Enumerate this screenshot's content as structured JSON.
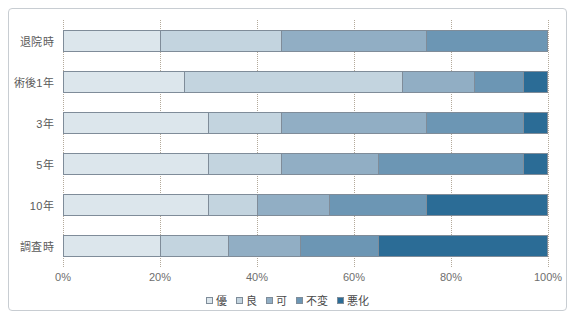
{
  "chart_data": {
    "type": "bar",
    "orientation": "horizontal",
    "stacked": true,
    "stacked_mode": "percent",
    "title": "",
    "subtitle": "",
    "xlabel": "",
    "ylabel": "",
    "xlim": [
      0,
      100
    ],
    "xticks": [
      0,
      20,
      40,
      60,
      80,
      100
    ],
    "xtick_labels": [
      "0%",
      "20%",
      "40%",
      "60%",
      "80%",
      "100%"
    ],
    "grid": true,
    "grid_axis": "x",
    "grid_style": "dotted",
    "legend_position": "bottom-center",
    "categories": [
      "退院時",
      "術後1年",
      "3年",
      "5年",
      "10年",
      "調査時"
    ],
    "series": [
      {
        "name": "優",
        "color": "#dce6ec",
        "values": [
          20,
          25,
          30,
          30,
          30,
          20
        ]
      },
      {
        "name": "良",
        "color": "#c3d4df",
        "values": [
          25,
          45,
          15,
          15,
          10,
          14
        ]
      },
      {
        "name": "可",
        "color": "#91aec4",
        "values": [
          30,
          15,
          30,
          20,
          15,
          15
        ]
      },
      {
        "name": "不変",
        "color": "#6c96b4",
        "values": [
          25,
          10,
          20,
          30,
          20,
          16
        ]
      },
      {
        "name": "悪化",
        "color": "#2b6c96",
        "values": [
          0,
          5,
          5,
          5,
          25,
          35
        ]
      }
    ]
  },
  "legend": {
    "items": [
      {
        "label": "優"
      },
      {
        "label": "良"
      },
      {
        "label": "可"
      },
      {
        "label": "不変"
      },
      {
        "label": "悪化"
      }
    ]
  },
  "colors": {
    "frame_border": "#c8cdd2",
    "gridline": "#b3a99a",
    "segment_border": "#7f8c99",
    "axis_text": "#6e6e6e",
    "category_text": "#5a5a5a"
  }
}
